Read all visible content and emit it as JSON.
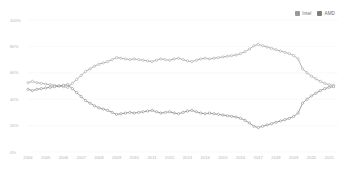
{
  "legend": {
    "position": "top-right",
    "items": [
      {
        "label": "Intel",
        "color": "#9a9a9a",
        "swatch_name": "legend-swatch-intel"
      },
      {
        "label": "AMD",
        "color": "#7d7d7d",
        "swatch_name": "legend-swatch-amd"
      }
    ]
  },
  "axes": {
    "y_ticks": [
      "100%",
      "80%",
      "60%",
      "40%",
      "20%",
      "0%"
    ],
    "x_ticks": [
      "2004",
      "2005",
      "2006",
      "2007",
      "2008",
      "2009",
      "2010",
      "2011",
      "2012",
      "2013",
      "2014",
      "2015",
      "2016",
      "2017",
      "2018",
      "2019",
      "2020",
      "2021"
    ]
  },
  "chart_data": {
    "type": "line",
    "title": "",
    "subtitle": "",
    "xlabel": "",
    "ylabel": "",
    "ylim": [
      0,
      100
    ],
    "xlim": [
      2004,
      2021.5
    ],
    "grid": true,
    "legend_position": "top-right",
    "units": "percent",
    "x": [
      2004.0,
      2004.25,
      2004.5,
      2004.75,
      2005.0,
      2005.25,
      2005.5,
      2005.75,
      2006.0,
      2006.25,
      2006.5,
      2006.75,
      2007.0,
      2007.25,
      2007.5,
      2007.75,
      2008.0,
      2008.25,
      2008.5,
      2008.75,
      2009.0,
      2009.25,
      2009.5,
      2009.75,
      2010.0,
      2010.25,
      2010.5,
      2010.75,
      2011.0,
      2011.25,
      2011.5,
      2011.75,
      2012.0,
      2012.25,
      2012.5,
      2012.75,
      2013.0,
      2013.25,
      2013.5,
      2013.75,
      2014.0,
      2014.25,
      2014.5,
      2014.75,
      2015.0,
      2015.25,
      2015.5,
      2015.75,
      2016.0,
      2016.25,
      2016.5,
      2016.75,
      2017.0,
      2017.25,
      2017.5,
      2017.75,
      2018.0,
      2018.25,
      2018.5,
      2018.75,
      2019.0,
      2019.25,
      2019.5,
      2019.75,
      2020.0,
      2020.25,
      2020.5,
      2020.75,
      2021.0,
      2021.25
    ],
    "series": [
      {
        "name": "Intel",
        "color": "#9a9a9a",
        "marker": "circle-open",
        "values": [
          52.5,
          53.5,
          52.5,
          52.0,
          51.5,
          51.0,
          50.5,
          50.0,
          49.5,
          49.0,
          52.0,
          55.0,
          58.0,
          61.0,
          63.0,
          65.0,
          66.5,
          67.5,
          68.5,
          70.0,
          71.5,
          71.0,
          70.5,
          70.0,
          70.5,
          70.0,
          69.5,
          69.0,
          68.5,
          69.5,
          70.5,
          70.0,
          69.5,
          70.5,
          71.0,
          70.0,
          69.0,
          68.5,
          69.5,
          70.5,
          71.0,
          70.5,
          71.0,
          71.5,
          72.0,
          72.5,
          73.0,
          73.5,
          74.5,
          76.0,
          78.0,
          80.5,
          81.5,
          80.5,
          79.5,
          78.5,
          77.5,
          76.5,
          75.5,
          74.5,
          73.0,
          70.5,
          63.0,
          60.0,
          57.5,
          55.5,
          53.5,
          52.0,
          51.0,
          50.5
        ]
      },
      {
        "name": "AMD",
        "color": "#7d7d7d",
        "marker": "circle-open",
        "values": [
          47.5,
          46.5,
          47.5,
          48.0,
          48.5,
          49.0,
          49.5,
          50.0,
          50.5,
          51.0,
          48.0,
          45.0,
          42.0,
          39.0,
          37.0,
          35.0,
          33.5,
          32.5,
          31.5,
          30.0,
          28.5,
          29.0,
          29.5,
          30.0,
          29.5,
          30.0,
          30.5,
          31.0,
          31.5,
          30.5,
          29.5,
          30.0,
          30.5,
          29.5,
          29.0,
          30.0,
          31.0,
          31.5,
          30.5,
          29.5,
          29.0,
          29.5,
          29.0,
          28.5,
          28.0,
          27.5,
          27.0,
          26.5,
          25.5,
          24.0,
          22.0,
          19.5,
          18.5,
          19.5,
          20.5,
          21.5,
          22.5,
          23.5,
          24.5,
          25.5,
          27.0,
          29.5,
          37.0,
          40.0,
          42.5,
          44.5,
          46.5,
          48.0,
          49.0,
          49.5
        ]
      }
    ]
  }
}
